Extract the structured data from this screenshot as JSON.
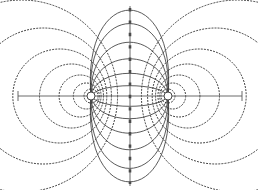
{
  "figure": {
    "background_color": "#ffffff",
    "width": 258,
    "height": 190
  },
  "axes": {
    "horizontal": {
      "name": "dipole-axis",
      "y": 96,
      "x_start": 18,
      "x_end": 242,
      "color": "#5a5a5a",
      "end_tick_half_height": 5
    },
    "vertical": {
      "name": "bisector-axis",
      "x": 130,
      "y_start": 6,
      "y_end": 186,
      "color": "#5a5a5a"
    }
  },
  "charges": [
    {
      "name": "charge-left",
      "label": "+",
      "cx": 91,
      "cy": 96,
      "r": 4.0
    },
    {
      "name": "charge-right",
      "label": "−",
      "cx": 168,
      "cy": 96,
      "r": 4.0
    }
  ],
  "chart_data": {
    "type": "line",
    "xlabel": "",
    "ylabel": "",
    "xlim": [
      18,
      242
    ],
    "ylim": [
      6,
      186
    ],
    "grid": false,
    "legend": "none",
    "annotations": [
      "Two opposite point charges on the horizontal axis",
      "Solid curves: electric field lines looping from one charge to the other",
      "Dotted curves: equipotential contours (Apollonius circles)",
      "Thick dashed vertical line: zero-potential bisector plane"
    ],
    "series": [
      {
        "name": "field-line-loops",
        "style": "solid",
        "color": "#3d3d3d",
        "description": "Closed loops through both charges, half-heights above/below the dipole axis",
        "loop_half_heights": [
          10,
          22,
          36,
          52,
          70,
          83
        ]
      },
      {
        "name": "equipotential-left",
        "style": "dotted",
        "color": "#2e2e2e",
        "description": "Circles enclosing the left charge, radii increasing outward",
        "radii": [
          7,
          13,
          21,
          32,
          47,
          68,
          96
        ]
      },
      {
        "name": "equipotential-right",
        "style": "dotted",
        "color": "#2e2e2e",
        "description": "Circles enclosing the right charge, radii increasing outward",
        "radii": [
          7,
          13,
          21,
          32,
          47,
          68,
          96
        ]
      },
      {
        "name": "equipotential-zero",
        "style": "thick-dashed",
        "color": "#4a4a4a",
        "description": "Straight vertical bisector at x = 130 where potential is zero"
      }
    ]
  }
}
